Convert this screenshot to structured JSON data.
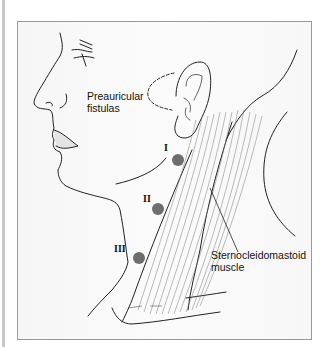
{
  "figure": {
    "labels": {
      "preauricular_line1": "Preauricular",
      "preauricular_line2": "fistulas",
      "scm_line1": "Sternocleidomastoid",
      "scm_line2": "muscle"
    },
    "fistula_sites": [
      {
        "label": "I",
        "x": 178,
        "y": 160
      },
      {
        "label": "II",
        "x": 158,
        "y": 209
      },
      {
        "label": "III",
        "x": 139,
        "y": 258
      }
    ],
    "colors": {
      "dot": "#6e6e6e",
      "line": "#222222",
      "frame": "#9a9a9a",
      "muscle_fibers": "#777777"
    }
  }
}
